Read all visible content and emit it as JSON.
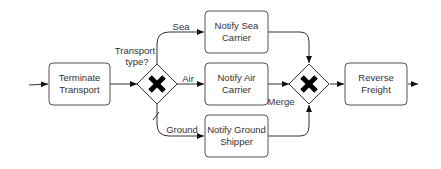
{
  "diagram": {
    "type": "BPMN process",
    "tasks": [
      {
        "id": "terminate",
        "line1": "Terminate",
        "line2": "Transport"
      },
      {
        "id": "sea",
        "line1": "Notify Sea",
        "line2": "Carrier"
      },
      {
        "id": "air",
        "line1": "Notify Air",
        "line2": "Carrier"
      },
      {
        "id": "ground",
        "line1": "Notify Ground",
        "line2": "Shipper"
      },
      {
        "id": "reverse",
        "line1": "Reverse",
        "line2": "Freight"
      }
    ],
    "gateways": [
      {
        "id": "split",
        "type": "exclusive",
        "label_line1": "Transport",
        "label_line2": "type?"
      },
      {
        "id": "merge",
        "type": "exclusive",
        "label": "Merge"
      }
    ],
    "edge_labels": {
      "sea": "Sea",
      "air": "Air",
      "ground": "Ground"
    }
  }
}
